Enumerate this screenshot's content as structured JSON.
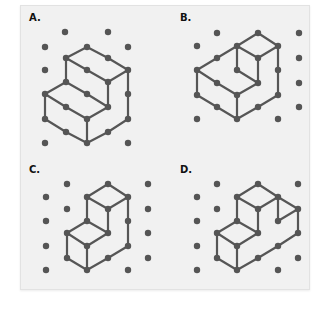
{
  "options": [
    {
      "label": "A.",
      "label_pos": [
        29,
        22
      ],
      "dots": [
        [
          65,
          32
        ],
        [
          108,
          32
        ],
        [
          45,
          47
        ],
        [
          87,
          47
        ],
        [
          128,
          47
        ],
        [
          66,
          58
        ],
        [
          108,
          58
        ],
        [
          45,
          70
        ],
        [
          87,
          70
        ],
        [
          128,
          70
        ],
        [
          66,
          82
        ],
        [
          108,
          82
        ],
        [
          45,
          94
        ],
        [
          87,
          94
        ],
        [
          128,
          94
        ],
        [
          66,
          107
        ],
        [
          108,
          107
        ],
        [
          45,
          119
        ],
        [
          87,
          119
        ],
        [
          128,
          119
        ],
        [
          66,
          132
        ],
        [
          108,
          132
        ],
        [
          45,
          143
        ],
        [
          87,
          143
        ],
        [
          128,
          143
        ]
      ],
      "edges": [
        [
          [
            87,
            47
          ],
          [
            66,
            58
          ]
        ],
        [
          [
            87,
            47
          ],
          [
            108,
            58
          ]
        ],
        [
          [
            108,
            58
          ],
          [
            128,
            70
          ]
        ],
        [
          [
            66,
            58
          ],
          [
            87,
            70
          ]
        ],
        [
          [
            87,
            70
          ],
          [
            108,
            82
          ]
        ],
        [
          [
            108,
            82
          ],
          [
            128,
            70
          ]
        ],
        [
          [
            66,
            58
          ],
          [
            66,
            82
          ]
        ],
        [
          [
            108,
            82
          ],
          [
            108,
            107
          ]
        ],
        [
          [
            66,
            82
          ],
          [
            45,
            94
          ]
        ],
        [
          [
            66,
            82
          ],
          [
            87,
            94
          ]
        ],
        [
          [
            87,
            94
          ],
          [
            108,
            107
          ]
        ],
        [
          [
            45,
            94
          ],
          [
            66,
            107
          ]
        ],
        [
          [
            66,
            107
          ],
          [
            87,
            119
          ]
        ],
        [
          [
            87,
            119
          ],
          [
            108,
            107
          ]
        ],
        [
          [
            45,
            94
          ],
          [
            45,
            119
          ]
        ],
        [
          [
            45,
            119
          ],
          [
            66,
            132
          ]
        ],
        [
          [
            66,
            132
          ],
          [
            87,
            143
          ]
        ],
        [
          [
            87,
            119
          ],
          [
            87,
            143
          ]
        ],
        [
          [
            87,
            143
          ],
          [
            108,
            132
          ]
        ],
        [
          [
            108,
            132
          ],
          [
            128,
            119
          ]
        ],
        [
          [
            128,
            70
          ],
          [
            128,
            94
          ]
        ],
        [
          [
            128,
            94
          ],
          [
            128,
            119
          ]
        ]
      ]
    },
    {
      "label": "B.",
      "label_pos": [
        180,
        22
      ],
      "dots": [
        [
          217,
          33
        ],
        [
          258,
          33
        ],
        [
          299,
          33
        ],
        [
          197,
          46
        ],
        [
          237,
          46
        ],
        [
          278,
          46
        ],
        [
          217,
          58
        ],
        [
          258,
          58
        ],
        [
          299,
          58
        ],
        [
          197,
          70
        ],
        [
          237,
          70
        ],
        [
          278,
          70
        ],
        [
          217,
          83
        ],
        [
          258,
          83
        ],
        [
          299,
          83
        ],
        [
          197,
          95
        ],
        [
          237,
          95
        ],
        [
          278,
          95
        ],
        [
          217,
          107
        ],
        [
          258,
          107
        ],
        [
          299,
          107
        ],
        [
          197,
          119
        ],
        [
          237,
          119
        ],
        [
          278,
          119
        ]
      ],
      "edges": [
        [
          [
            258,
            33
          ],
          [
            278,
            46
          ]
        ],
        [
          [
            237,
            46
          ],
          [
            258,
            33
          ]
        ],
        [
          [
            237,
            46
          ],
          [
            258,
            58
          ]
        ],
        [
          [
            258,
            58
          ],
          [
            278,
            46
          ]
        ],
        [
          [
            237,
            46
          ],
          [
            217,
            58
          ]
        ],
        [
          [
            217,
            58
          ],
          [
            197,
            70
          ]
        ],
        [
          [
            237,
            46
          ],
          [
            237,
            70
          ]
        ],
        [
          [
            237,
            70
          ],
          [
            258,
            83
          ]
        ],
        [
          [
            258,
            58
          ],
          [
            258,
            83
          ]
        ],
        [
          [
            197,
            70
          ],
          [
            217,
            83
          ]
        ],
        [
          [
            217,
            83
          ],
          [
            237,
            95
          ]
        ],
        [
          [
            237,
            95
          ],
          [
            258,
            83
          ]
        ],
        [
          [
            197,
            70
          ],
          [
            197,
            95
          ]
        ],
        [
          [
            197,
            95
          ],
          [
            217,
            107
          ]
        ],
        [
          [
            217,
            107
          ],
          [
            237,
            119
          ]
        ],
        [
          [
            237,
            95
          ],
          [
            237,
            119
          ]
        ],
        [
          [
            237,
            119
          ],
          [
            258,
            107
          ]
        ],
        [
          [
            258,
            107
          ],
          [
            278,
            95
          ]
        ],
        [
          [
            278,
            46
          ],
          [
            278,
            70
          ]
        ],
        [
          [
            278,
            70
          ],
          [
            278,
            95
          ]
        ]
      ]
    },
    {
      "label": "C.",
      "label_pos": [
        29,
        174
      ],
      "dots": [
        [
          67,
          184
        ],
        [
          108,
          184
        ],
        [
          148,
          184
        ],
        [
          46,
          197
        ],
        [
          87,
          197
        ],
        [
          128,
          197
        ],
        [
          67,
          209
        ],
        [
          108,
          209
        ],
        [
          148,
          209
        ],
        [
          46,
          221
        ],
        [
          87,
          221
        ],
        [
          128,
          221
        ],
        [
          67,
          233
        ],
        [
          108,
          233
        ],
        [
          148,
          233
        ],
        [
          46,
          246
        ],
        [
          87,
          246
        ],
        [
          128,
          246
        ],
        [
          67,
          258
        ],
        [
          108,
          258
        ],
        [
          148,
          258
        ],
        [
          46,
          270
        ],
        [
          87,
          270
        ],
        [
          128,
          270
        ]
      ],
      "edges": [
        [
          [
            87,
            197
          ],
          [
            108,
            184
          ]
        ],
        [
          [
            108,
            184
          ],
          [
            128,
            197
          ]
        ],
        [
          [
            87,
            197
          ],
          [
            108,
            209
          ]
        ],
        [
          [
            108,
            209
          ],
          [
            128,
            197
          ]
        ],
        [
          [
            87,
            197
          ],
          [
            87,
            221
          ]
        ],
        [
          [
            108,
            209
          ],
          [
            108,
            233
          ]
        ],
        [
          [
            128,
            197
          ],
          [
            128,
            221
          ]
        ],
        [
          [
            128,
            221
          ],
          [
            128,
            246
          ]
        ],
        [
          [
            87,
            221
          ],
          [
            67,
            233
          ]
        ],
        [
          [
            87,
            221
          ],
          [
            108,
            233
          ]
        ],
        [
          [
            67,
            233
          ],
          [
            87,
            246
          ]
        ],
        [
          [
            87,
            246
          ],
          [
            108,
            233
          ]
        ],
        [
          [
            67,
            233
          ],
          [
            67,
            258
          ]
        ],
        [
          [
            67,
            258
          ],
          [
            87,
            270
          ]
        ],
        [
          [
            87,
            246
          ],
          [
            87,
            270
          ]
        ],
        [
          [
            87,
            270
          ],
          [
            108,
            258
          ]
        ],
        [
          [
            108,
            258
          ],
          [
            128,
            246
          ]
        ]
      ]
    },
    {
      "label": "D.",
      "label_pos": [
        180,
        174
      ],
      "dots": [
        [
          217,
          184
        ],
        [
          258,
          184
        ],
        [
          298,
          184
        ],
        [
          197,
          197
        ],
        [
          237,
          197
        ],
        [
          278,
          197
        ],
        [
          217,
          209
        ],
        [
          258,
          209
        ],
        [
          298,
          209
        ],
        [
          197,
          221
        ],
        [
          237,
          221
        ],
        [
          278,
          221
        ],
        [
          217,
          233
        ],
        [
          258,
          233
        ],
        [
          298,
          233
        ],
        [
          197,
          246
        ],
        [
          237,
          246
        ],
        [
          278,
          246
        ],
        [
          217,
          258
        ],
        [
          258,
          258
        ],
        [
          298,
          258
        ],
        [
          197,
          270
        ],
        [
          237,
          270
        ],
        [
          278,
          270
        ]
      ],
      "edges": [
        [
          [
            237,
            197
          ],
          [
            258,
            184
          ]
        ],
        [
          [
            258,
            184
          ],
          [
            278,
            197
          ]
        ],
        [
          [
            278,
            197
          ],
          [
            298,
            209
          ]
        ],
        [
          [
            237,
            197
          ],
          [
            258,
            209
          ]
        ],
        [
          [
            258,
            209
          ],
          [
            278,
            197
          ]
        ],
        [
          [
            237,
            197
          ],
          [
            237,
            221
          ]
        ],
        [
          [
            258,
            209
          ],
          [
            258,
            233
          ]
        ],
        [
          [
            278,
            197
          ],
          [
            278,
            221
          ]
        ],
        [
          [
            278,
            221
          ],
          [
            298,
            209
          ]
        ],
        [
          [
            298,
            209
          ],
          [
            298,
            233
          ]
        ],
        [
          [
            237,
            221
          ],
          [
            217,
            233
          ]
        ],
        [
          [
            237,
            221
          ],
          [
            258,
            233
          ]
        ],
        [
          [
            217,
            233
          ],
          [
            237,
            246
          ]
        ],
        [
          [
            237,
            246
          ],
          [
            258,
            233
          ]
        ],
        [
          [
            217,
            233
          ],
          [
            217,
            258
          ]
        ],
        [
          [
            217,
            258
          ],
          [
            237,
            270
          ]
        ],
        [
          [
            237,
            246
          ],
          [
            237,
            270
          ]
        ],
        [
          [
            237,
            270
          ],
          [
            258,
            258
          ]
        ],
        [
          [
            258,
            258
          ],
          [
            278,
            246
          ]
        ],
        [
          [
            278,
            246
          ],
          [
            298,
            233
          ]
        ]
      ]
    }
  ],
  "colors": {
    "line": "#565656",
    "dot": "#555555",
    "panel": "#f1f1f1"
  }
}
